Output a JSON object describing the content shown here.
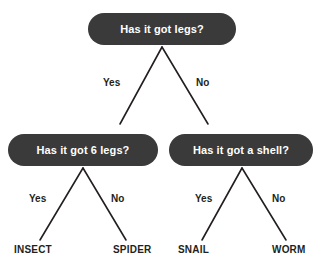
{
  "diagram": {
    "type": "decision-tree",
    "colors": {
      "node_fill": "#3a3a3a",
      "node_text": "#ffffff",
      "label_text": "#231f20",
      "line": "#231f20",
      "background": "#ffffff"
    },
    "nodes": {
      "root": {
        "label": "Has it got legs?"
      },
      "left": {
        "label": "Has it got 6 legs?"
      },
      "right": {
        "label": "Has it got a shell?"
      }
    },
    "edges": {
      "root_yes": "Yes",
      "root_no": "No",
      "left_yes": "Yes",
      "left_no": "No",
      "right_yes": "Yes",
      "right_no": "No"
    },
    "leaves": {
      "insect": "INSECT",
      "spider": "SPIDER",
      "snail": "SNAIL",
      "worm": "WORM"
    }
  }
}
